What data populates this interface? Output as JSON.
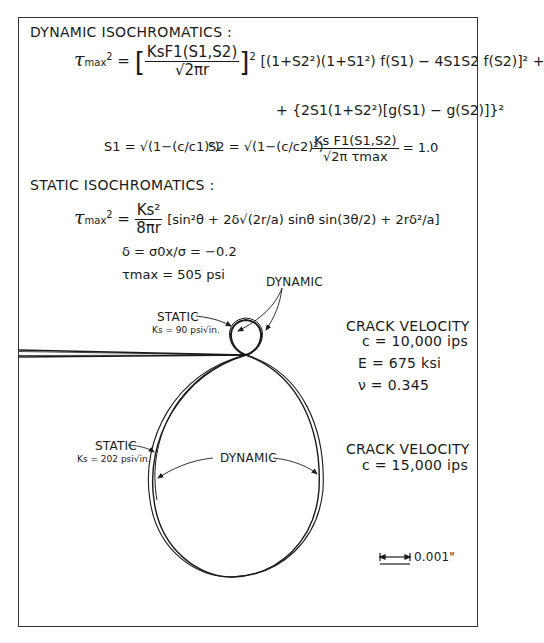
{
  "dynamic": {
    "heading": "DYNAMIC ISOCHROMATICS :",
    "eq1_lhs": "τmax² =",
    "eq1_prefactor_num": "KsF1(S1,S2)",
    "eq1_prefactor_den": "√2πr",
    "eq1_line1": "[(1+S2²)(1+S1²) f(S1) − 4S1S2 f(S2)]² +",
    "eq1_line2": "+ {2S1(1+S2²)[g(S1) − g(S2)]}²",
    "s1_def": "S1 = √(1−(c/c1)²)",
    "s2_def": "S2 = √(1−(c/c2)²)",
    "norm_num": "Ks F1(S1,S2)",
    "norm_den": "√2π τmax",
    "norm_value": "= 1.0"
  },
  "static": {
    "heading": "STATIC ISOCHROMATICS :",
    "eq_lhs": "τmax² =",
    "eq_pref_num": "Ks²",
    "eq_pref_den": "8πr",
    "eq_bracket": "[sin²θ + 2δ√(2r/a) sinθ sin(3θ/2) + 2rδ²/a]",
    "delta_def": "δ = σ0x/σ = −0.2",
    "tau_max": "τmax = 505 psi"
  },
  "figure": {
    "label_dynamic_top": "DYNAMIC",
    "label_static_small": "STATIC",
    "ks_small": "Ks = 90 psi√in.",
    "label_static_large": "STATIC",
    "ks_large": "Ks = 202 psi√in.",
    "label_dynamic_large": "DYNAMIC",
    "case1": {
      "title": "CRACK VELOCITY",
      "velocity": "c = 10,000 ips",
      "modulus": "E = 675 ksi",
      "poisson": "ν = 0.345"
    },
    "case2": {
      "title": "CRACK VELOCITY",
      "velocity": "c = 15,000 ips"
    },
    "scale_bar": "0.001\""
  }
}
